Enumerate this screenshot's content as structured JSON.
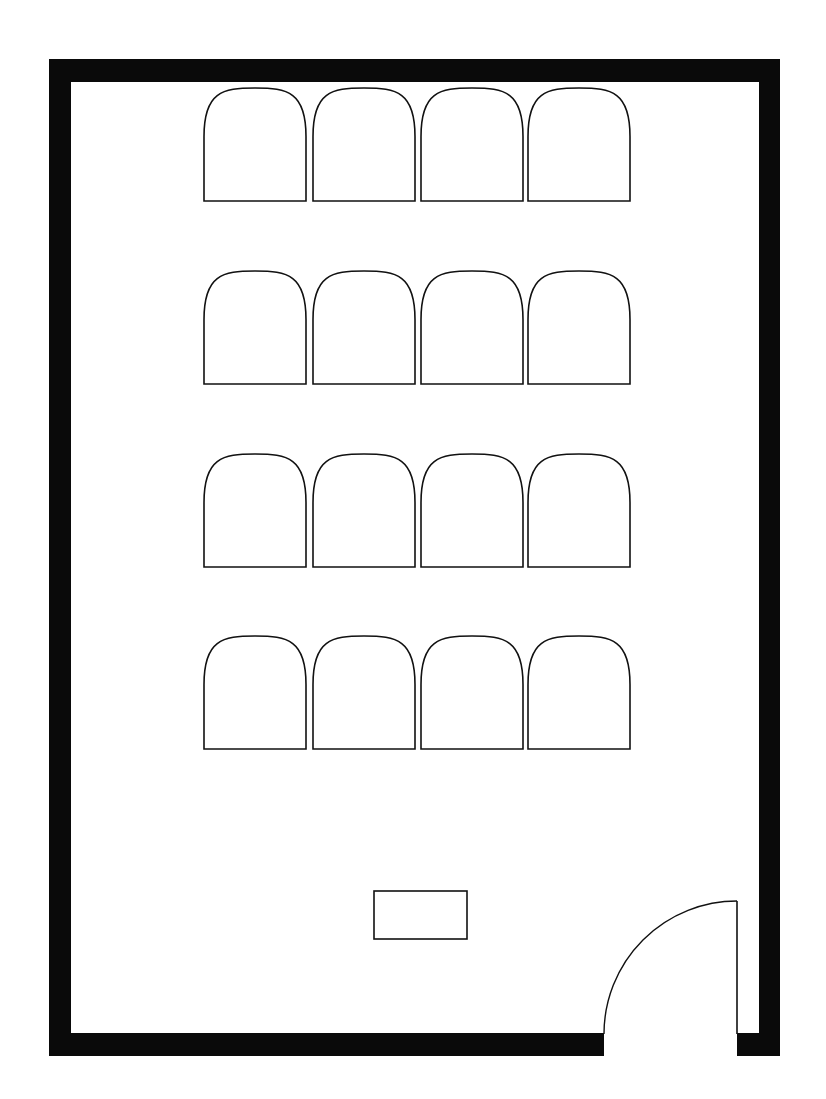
{
  "diagram": {
    "type": "floor-plan",
    "colors": {
      "wall": "#0a0a0a",
      "outline": "#111111",
      "background": "#ffffff"
    }
  },
  "room": {
    "walls": {
      "outer": {
        "x": 50,
        "y": 59,
        "w": 730,
        "h": 997
      },
      "thickness": 21
    },
    "door": {
      "gap_start_x": 604,
      "gap_end_x": 737,
      "leaf_x": 737,
      "leaf_top_y": 901,
      "sill_y": 1034,
      "swing": "inward-left"
    }
  },
  "seating": {
    "rows": 4,
    "cols": 4,
    "chair_width": 102,
    "chair_height": 113,
    "col_x": [
      204,
      313,
      421,
      528
    ],
    "row_y": [
      88,
      271,
      454,
      636
    ]
  },
  "desk": {
    "x": 374,
    "y": 891,
    "w": 93,
    "h": 48
  },
  "labels": {
    "room": "Room floor plan",
    "chair": "Chair",
    "desk": "Desk",
    "door": "Door"
  }
}
